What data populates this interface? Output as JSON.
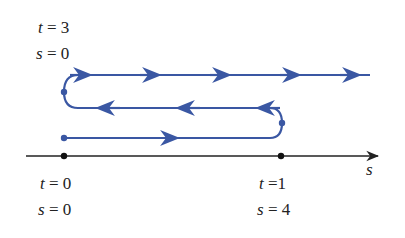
{
  "colors": {
    "path": "#3a57a3",
    "axis": "#222222"
  },
  "labels": {
    "top_t": {
      "var": "t",
      "text": " = 3"
    },
    "top_s": {
      "var": "s",
      "text": " = 0"
    },
    "left_t": {
      "var": "t",
      "text": " = 0"
    },
    "left_s": {
      "var": "s",
      "text": " = 0"
    },
    "right_t": {
      "var": "t",
      "text": " =1"
    },
    "right_s": {
      "var": "s",
      "text": " = 4"
    },
    "axis": "s"
  }
}
